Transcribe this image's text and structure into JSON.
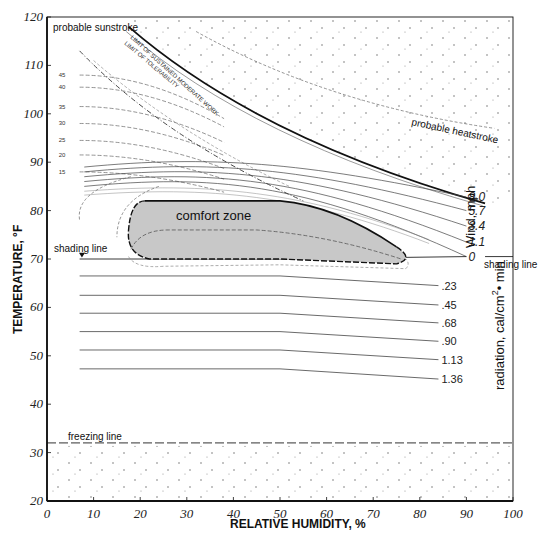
{
  "chart_data": {
    "type": "line",
    "title": "",
    "xlabel": "RELATIVE HUMIDITY, %",
    "ylabel": "TEMPERATURE, °F",
    "xlim": [
      0,
      100
    ],
    "ylim": [
      20,
      120
    ],
    "x_ticks": [
      0,
      10,
      20,
      30,
      40,
      50,
      60,
      70,
      80,
      90,
      100
    ],
    "y_ticks": [
      20,
      30,
      40,
      50,
      60,
      70,
      80,
      90,
      100,
      110,
      120
    ],
    "grid": false,
    "regions": [
      {
        "name": "comfort zone",
        "fill": "#c8c8c8",
        "rh_range": [
          18,
          78
        ],
        "temp_range": [
          70,
          82
        ]
      },
      {
        "name": "probable sunstroke",
        "position": "upper-left"
      },
      {
        "name": "probable heatstroke",
        "position": "upper-right"
      },
      {
        "name": "freezing line",
        "temp": 32
      }
    ],
    "wind_lines": {
      "title": "Wind, mph",
      "series": [
        {
          "name": "0",
          "right_temp": 70.5
        },
        {
          "name": "1.1",
          "right_temp": 73.5
        },
        {
          "name": "3.4",
          "right_temp": 76.8
        },
        {
          "name": "5.7",
          "right_temp": 80
        },
        {
          "name": "8.0",
          "right_temp": 82.8
        }
      ]
    },
    "radiation_lines": {
      "title": "radiation, cal/cm² • min",
      "series": [
        {
          "name": ".23",
          "left_temp": 66.5,
          "right_temp": 64.5
        },
        {
          "name": ".45",
          "left_temp": 62.5,
          "right_temp": 60.5
        },
        {
          "name": ".68",
          "left_temp": 58.8,
          "right_temp": 56.8
        },
        {
          "name": ".90",
          "left_temp": 55,
          "right_temp": 53
        },
        {
          "name": "1.13",
          "left_temp": 51.2,
          "right_temp": 49.2
        },
        {
          "name": "1.36",
          "left_temp": 47.3,
          "right_temp": 45.2
        }
      ],
      "bend_rh": 50
    },
    "vapor_pressure_curves": {
      "labels": [
        "45",
        "40",
        "35",
        "30",
        "25",
        "20",
        "15",
        "10",
        "5"
      ]
    },
    "diagonal_labels": [
      "50",
      "45",
      "40",
      "35",
      "30",
      "25",
      "15",
      "10",
      "5",
      "0"
    ],
    "shading_line_temp": 70
  },
  "labels": {
    "sunstroke": "probable sunstroke",
    "heatstroke": "probable heatstroke",
    "comfort": "comfort zone",
    "shading_left": "shading line",
    "shading_right": "shading line",
    "freezing": "freezing line",
    "wind_title": "Wind, mph",
    "rad_title": "radiation, cal/cm",
    "rad_sup": "2",
    "rad_tail": "• min",
    "xlabel": "RELATIVE HUMIDITY, %",
    "ylabel": "TEMPERATURE, °F",
    "curve_label_a": "LIMIT OF SUSTAINED MODERATE WORK",
    "curve_label_b": "LIMIT OF TOLERABILITY"
  }
}
